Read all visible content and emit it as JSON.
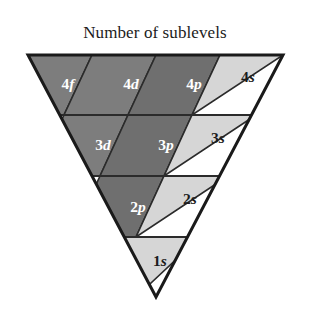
{
  "figure": {
    "title": "Number of sublevels",
    "shape": "inverted-triangle",
    "background_color": "#ffffff",
    "outline_color": "#1a1a1a",
    "divider_color": "#2b2b2b",
    "geometry": {
      "top_left_x": 28,
      "top_right_x": 283,
      "top_y": 55,
      "apex_x": 156,
      "apex_y": 297,
      "row_lines_y": [
        115,
        176,
        237
      ]
    },
    "palette": {
      "dark_gray": "#7d7d7d",
      "mid_gray": "#6f6f6f",
      "light_gray": "#d6d6d6",
      "white_text": "#ffffff",
      "dark_text": "#1c1c1c"
    },
    "rows": [
      {
        "row": 1,
        "cells": [
          {
            "id": "cell-4f",
            "number": "4",
            "orbital": "f",
            "label": "4f",
            "fill": "dark_gray",
            "text_color": "white_text",
            "points": "28,55 92,55 64,115 0,115",
            "label_x": 68,
            "label_y": 85
          },
          {
            "id": "cell-4d",
            "number": "4",
            "orbital": "d",
            "label": "4d",
            "fill": "dark_gray",
            "text_color": "white_text",
            "points": "92,55 156,55 128,115 64,115",
            "label_x": 131,
            "label_y": 85
          },
          {
            "id": "cell-4p",
            "number": "4",
            "orbital": "p",
            "label": "4p",
            "fill": "mid_gray",
            "text_color": "white_text",
            "points": "156,55 220,55 192,115 128,115",
            "label_x": 194,
            "label_y": 85
          },
          {
            "id": "cell-4s",
            "number": "4",
            "orbital": "s",
            "label": "4s",
            "fill": "light_gray",
            "text_color": "dark_text",
            "points": "220,55 283,55 192,115",
            "label_x": 248,
            "label_y": 78
          }
        ]
      },
      {
        "row": 2,
        "cells": [
          {
            "id": "cell-3d",
            "number": "3",
            "orbital": "d",
            "label": "3d",
            "fill": "dark_gray",
            "text_color": "white_text",
            "points": "64,115 128,115 100,176 36,176",
            "label_x": 103,
            "label_y": 146
          },
          {
            "id": "cell-3p",
            "number": "3",
            "orbital": "p",
            "label": "3p",
            "fill": "mid_gray",
            "text_color": "white_text",
            "points": "128,115 192,115 164,176 100,176",
            "label_x": 166,
            "label_y": 146
          },
          {
            "id": "cell-3s",
            "number": "3",
            "orbital": "s",
            "label": "3s",
            "fill": "light_gray",
            "text_color": "dark_text",
            "points": "192,115 256,115 164,176",
            "label_x": 218,
            "label_y": 139
          }
        ]
      },
      {
        "row": 3,
        "cells": [
          {
            "id": "cell-2p",
            "number": "2",
            "orbital": "p",
            "label": "2p",
            "fill": "mid_gray",
            "text_color": "white_text",
            "points": "100,176 164,176 136,237 72,237",
            "label_x": 138,
            "label_y": 208
          },
          {
            "id": "cell-2s",
            "number": "2",
            "orbital": "s",
            "label": "2s",
            "fill": "light_gray",
            "text_color": "dark_text",
            "points": "164,176 228,176 136,237",
            "label_x": 190,
            "label_y": 200
          }
        ]
      },
      {
        "row": 4,
        "cells": [
          {
            "id": "cell-1s",
            "number": "1",
            "orbital": "s",
            "label": "1s",
            "fill": "light_gray",
            "text_color": "dark_text",
            "points": "72,237 200,237 136,297",
            "label_x": 160,
            "label_y": 262
          }
        ]
      }
    ]
  }
}
